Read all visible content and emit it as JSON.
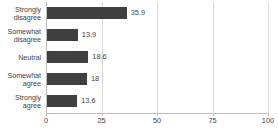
{
  "chart_data": {
    "type": "bar",
    "orientation": "horizontal",
    "title": "",
    "xlabel": "",
    "ylabel": "",
    "categories": [
      "Strongly disagree",
      "Somewhat disagree",
      "Neutral",
      "Somewhat agree",
      "Strongly agree"
    ],
    "category_lines": [
      [
        "Strongly",
        "disagree"
      ],
      [
        "Somewhat",
        "disagree"
      ],
      [
        "Neutral"
      ],
      [
        "Somewhat",
        "agree"
      ],
      [
        "Strongly",
        "agree"
      ]
    ],
    "values": [
      35.9,
      13.9,
      18.6,
      18,
      13.6
    ],
    "value_labels": [
      "35.9",
      "13.9",
      "18.6",
      "18",
      "13.6"
    ],
    "xlim": [
      0,
      100
    ],
    "xticks": [
      0,
      25,
      50,
      75,
      100
    ],
    "xtick_labels": [
      "0",
      "25",
      "50",
      "75",
      "100"
    ],
    "grid": true,
    "legend": "none",
    "bar_color": "#404040",
    "gridline_color": "#d9d9d9",
    "axis_color": "#bfbfbf",
    "text_color": "#3f3f3f"
  }
}
